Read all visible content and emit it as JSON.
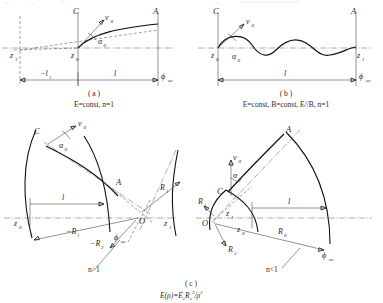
{
  "figure": {
    "title_fragment_top": "",
    "panels": [
      {
        "id": "a",
        "caption": "( a )",
        "condition": "E=const, n=1",
        "labels": {
          "plate_C": "C",
          "plate_A": "A",
          "velocity": "v",
          "velocity_sub": "0",
          "angle": "α",
          "angle_sub": "0",
          "z_start": "z",
          "z_start_sub": "0",
          "z_virtual": "z",
          "z_virtual_sub": "1",
          "dim_neg_l": "−l",
          "dim_neg_l_sub": "1",
          "dim_l": "l",
          "phi": "ϕ",
          "phi_sub": "ac"
        }
      },
      {
        "id": "b",
        "caption": "( b )",
        "condition": "E=const, B=const, E//B, n=1",
        "labels": {
          "plate_C": "C",
          "plate_A": "A",
          "velocity": "v",
          "velocity_sub": "0",
          "angle": "α",
          "angle_sub": "0",
          "z_start": "z",
          "z_start_sub": "0",
          "z_end": "z",
          "z_end_sub": "1",
          "dim_l": "l",
          "phi": "ϕ",
          "phi_sub": "ac"
        }
      },
      {
        "id": "c",
        "caption": "( c )",
        "formula_main": "E(ρ)=E",
        "formula_sub1": "c",
        "formula_mid": "R",
        "formula_sub2": "c",
        "formula_sup": "2",
        "formula_tail": "/ρ",
        "formula_sup2": "2",
        "left": {
          "regime": "n>1",
          "plate_C": "C",
          "plate_A": "A",
          "velocity": "v",
          "velocity_sub": "0",
          "angle": "α",
          "angle_sub": "0",
          "z_start": "z",
          "z_start_sub": "0",
          "z_end": "z",
          "z_end_sub": "1",
          "origin": "O",
          "radius_1": "−R",
          "radius_1_sub": "1",
          "radius_2": "−R",
          "radius_2_sub": "2",
          "radius_3": "R",
          "radius_3_sub": "1",
          "dim_l": "l",
          "phi": "ϕ",
          "phi_sub": "ac"
        },
        "right": {
          "regime": "n<1",
          "plate_C": "C",
          "plate_A": "A",
          "velocity": "v",
          "velocity_sub": "0",
          "angle": "α",
          "angle_sub": "0",
          "z_start": "z",
          "z_start_sub": "0",
          "z_end": "z",
          "z_end_sub": "1",
          "origin": "O",
          "radius_1": "R",
          "radius_1_sub": "1",
          "radius_2": "R",
          "radius_2_sub": "2",
          "radius_3": "R",
          "radius_3_sub": "0",
          "dim_l": "l",
          "phi": "ϕ",
          "phi_sub": "ac"
        }
      }
    ]
  }
}
